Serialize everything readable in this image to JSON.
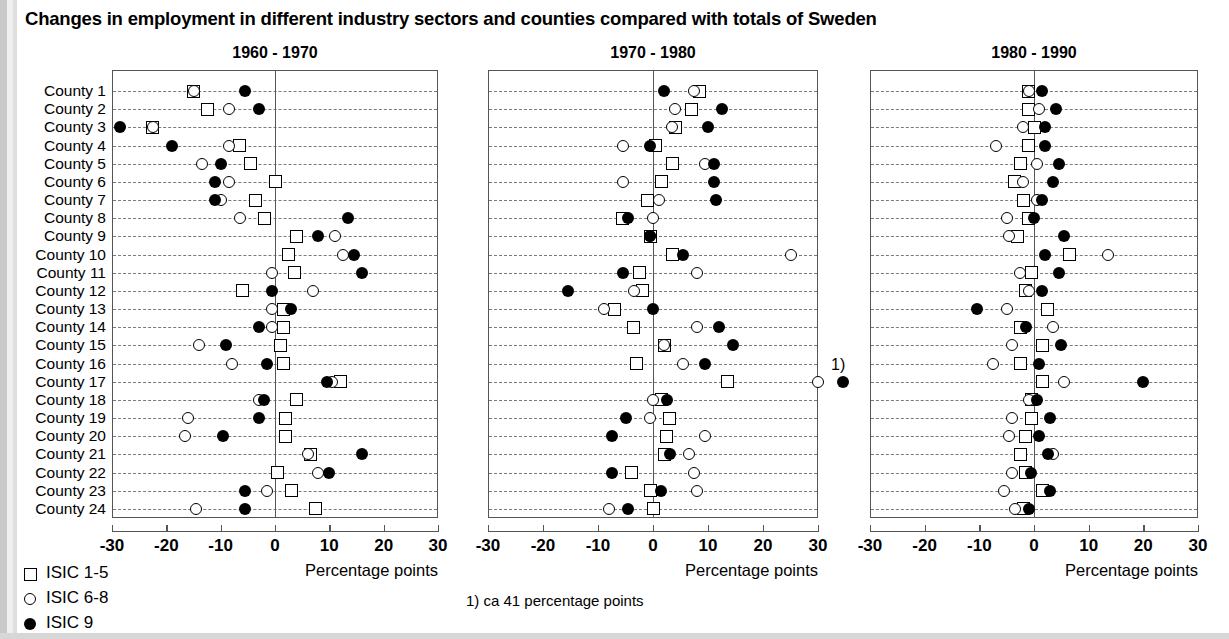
{
  "title": "Changes in employment in different industry sectors and counties compared with totals of Sweden",
  "footnote": "1) ca 41 percentage points",
  "footnote_marker": "1)",
  "legend": {
    "items": [
      {
        "symbol": "open-square",
        "label": "ISIC 1-5"
      },
      {
        "symbol": "open-circle",
        "label": "ISIC 6-8"
      },
      {
        "symbol": "filled-circle",
        "label": "ISIC 9"
      }
    ]
  },
  "axis": {
    "caption": "Percentage points",
    "ticks": [
      "-30",
      "-20",
      "-10",
      "0",
      "10",
      "20",
      "30"
    ],
    "xlim": [
      -30,
      30
    ]
  },
  "row_labels": [
    "County  1",
    "County  2",
    "County  3",
    "County  4",
    "County  5",
    "County  6",
    "County  7",
    "County  8",
    "County  9",
    "County 10",
    "County 11",
    "County 12",
    "County 13",
    "County 14",
    "County 15",
    "County 16",
    "County 17",
    "County 18",
    "County 19",
    "County 20",
    "County 21",
    "County 22",
    "County 23",
    "County 24"
  ],
  "chart_data": {
    "type": "scatter",
    "title": "Changes in employment in different industry sectors and counties compared with totals of Sweden",
    "xlabel": "Percentage points",
    "ylabel": "",
    "xlim": [
      -30,
      30
    ],
    "grid": true,
    "legend_position": "bottom-left",
    "categories": [
      "County  1",
      "County  2",
      "County  3",
      "County  4",
      "County  5",
      "County  6",
      "County  7",
      "County  8",
      "County  9",
      "County 10",
      "County 11",
      "County 12",
      "County 13",
      "County 14",
      "County 15",
      "County 16",
      "County 17",
      "County 18",
      "County 19",
      "County 20",
      "County 21",
      "County 22",
      "County 23",
      "County 24"
    ],
    "panels": [
      {
        "title": "1960 - 1970",
        "series": [
          {
            "name": "ISIC 1-5",
            "symbol": "open-square",
            "values": [
              -15.0,
              -12.5,
              -22.5,
              -6.5,
              -4.5,
              0.0,
              -3.5,
              -2.0,
              4.0,
              2.5,
              3.5,
              -6.0,
              1.5,
              1.5,
              1.0,
              1.5,
              12.0,
              4.0,
              2.0,
              2.0,
              6.5,
              0.5,
              3.0,
              7.5
            ]
          },
          {
            "name": "ISIC 6-8",
            "symbol": "open-circle",
            "values": [
              -15.0,
              -8.5,
              -22.5,
              -8.5,
              -13.5,
              -8.5,
              -10.0,
              -6.5,
              11.0,
              12.5,
              -0.5,
              7.0,
              -0.5,
              -0.5,
              -14.0,
              -8.0,
              10.5,
              -3.0,
              -16.0,
              -16.5,
              6.0,
              8.0,
              -1.5,
              -14.5
            ]
          },
          {
            "name": "ISIC 9",
            "symbol": "filled-circle",
            "values": [
              -5.5,
              -3.0,
              -28.5,
              -19.0,
              -10.0,
              -11.0,
              -11.0,
              13.5,
              8.0,
              14.5,
              16.0,
              -0.5,
              3.0,
              -3.0,
              -9.0,
              -1.5,
              9.5,
              -2.0,
              -3.0,
              -9.5,
              16.0,
              10.0,
              -5.5,
              -5.5
            ]
          }
        ]
      },
      {
        "title": "1970 - 1980",
        "series": [
          {
            "name": "ISIC 1-5",
            "symbol": "open-square",
            "values": [
              8.5,
              7.0,
              4.0,
              0.5,
              3.5,
              1.5,
              -1.0,
              -5.5,
              -0.5,
              3.5,
              -2.5,
              -2.0,
              -7.0,
              -3.5,
              2.0,
              -3.0,
              13.5,
              1.5,
              3.0,
              2.5,
              2.0,
              -4.0,
              -0.5,
              0.0
            ]
          },
          {
            "name": "ISIC 6-8",
            "symbol": "open-circle",
            "values": [
              7.5,
              4.0,
              3.5,
              -5.5,
              9.5,
              -5.5,
              1.0,
              0.0,
              -0.5,
              25.0,
              8.0,
              -3.5,
              -9.0,
              8.0,
              2.0,
              5.5,
              30.0,
              0.0,
              -0.5,
              9.5,
              6.5,
              7.5,
              8.0,
              -8.0
            ]
          },
          {
            "name": "ISIC 9",
            "symbol": "filled-circle",
            "values": [
              2.0,
              12.5,
              10.0,
              -0.5,
              11.0,
              11.0,
              11.5,
              -4.5,
              -0.5,
              5.5,
              -5.5,
              -15.5,
              0.0,
              12.0,
              14.5,
              9.5,
              41.0,
              2.5,
              -5.0,
              -7.5,
              3.0,
              -7.5,
              1.5,
              -4.5
            ]
          }
        ]
      },
      {
        "title": "1980 - 1990",
        "series": [
          {
            "name": "ISIC 1-5",
            "symbol": "open-square",
            "values": [
              -1.0,
              -1.0,
              0.0,
              -1.0,
              -2.5,
              -3.5,
              -2.0,
              -1.0,
              -3.0,
              6.5,
              -0.5,
              -1.5,
              2.5,
              -2.5,
              1.5,
              -2.5,
              1.5,
              -0.5,
              -0.5,
              -1.5,
              -2.5,
              -1.5,
              1.5,
              -2.0
            ]
          },
          {
            "name": "ISIC 6-8",
            "symbol": "open-circle",
            "values": [
              -1.0,
              1.0,
              -2.0,
              -7.0,
              0.5,
              -2.0,
              0.5,
              -5.0,
              -4.5,
              13.5,
              -2.5,
              -1.0,
              -5.0,
              3.5,
              -4.0,
              -7.5,
              5.5,
              -1.0,
              -4.0,
              -4.5,
              3.5,
              -4.0,
              -5.5,
              -3.5
            ]
          },
          {
            "name": "ISIC 9",
            "symbol": "filled-circle",
            "values": [
              1.5,
              4.0,
              2.0,
              2.0,
              4.5,
              3.5,
              1.5,
              0.0,
              5.5,
              2.0,
              4.5,
              1.5,
              -10.5,
              -1.5,
              5.0,
              1.0,
              20.0,
              0.5,
              3.0,
              1.0,
              2.5,
              -0.5,
              3.0,
              -1.0
            ]
          }
        ]
      }
    ],
    "annotations": [
      {
        "text": "1)",
        "panel": 1,
        "row": "County 17",
        "note": "ca 41 percentage points (off scale)"
      }
    ]
  }
}
